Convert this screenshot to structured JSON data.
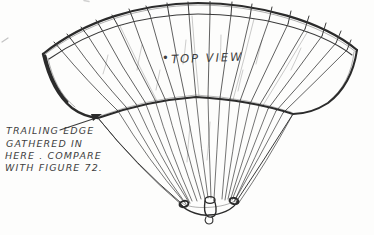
{
  "figure": {
    "subject_label": "TOP VIEW",
    "subject_marker": "•",
    "annotation": {
      "lines": [
        "TRAILING EDGE",
        "GATHERED IN",
        "HERE . COMPARE",
        "WITH FIGURE 72."
      ]
    }
  },
  "colors": {
    "paper": "#fdfdfc",
    "ink": "#3a3a3a",
    "ink_heavy": "#2b2b2b",
    "text_ink": "#3f3f3f"
  }
}
